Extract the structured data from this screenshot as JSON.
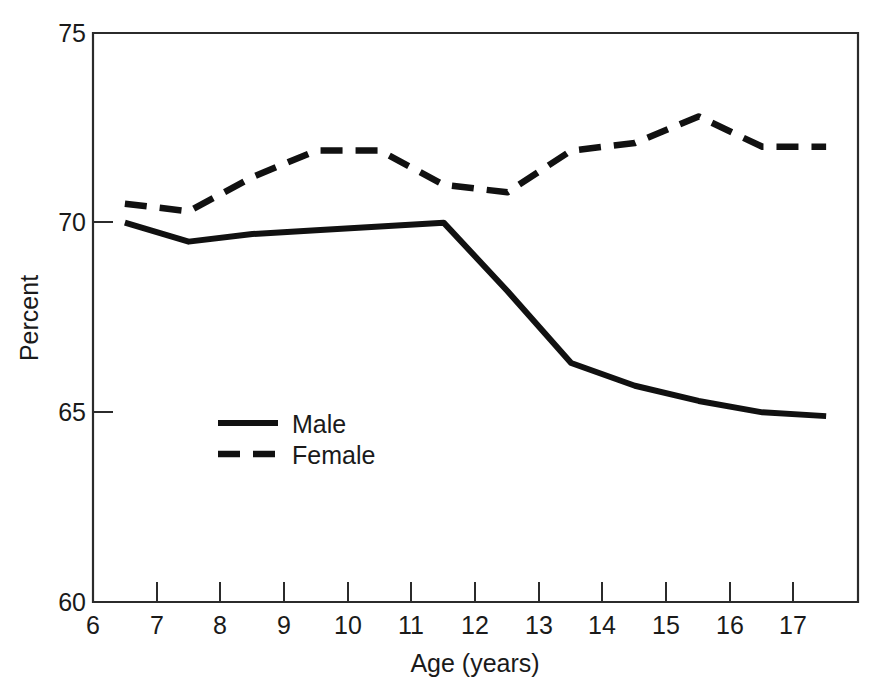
{
  "chart_data": {
    "type": "line",
    "title": "",
    "subtitle": "",
    "xlabel": "Age (years)",
    "ylabel": "Percent",
    "xlim": [
      6,
      18
    ],
    "ylim": [
      60,
      75
    ],
    "xticks": [
      6,
      7,
      8,
      9,
      10,
      11,
      12,
      13,
      14,
      15,
      16,
      17
    ],
    "xtick_labels": [
      "6",
      "7",
      "8",
      "9",
      "10",
      "11",
      "12",
      "13",
      "14",
      "15",
      "16",
      "17"
    ],
    "yticks": [
      60,
      65,
      70,
      75
    ],
    "ytick_labels": [
      "60",
      "65",
      "70",
      "75"
    ],
    "grid": false,
    "legend_position": "center-left-inside",
    "x": [
      6.5,
      7.5,
      8.5,
      9.5,
      10.5,
      11.5,
      12.5,
      13.5,
      14.5,
      15.5,
      16.5,
      17.5
    ],
    "series": [
      {
        "name": "Male",
        "style": "solid",
        "color": "#111111",
        "values": [
          70.0,
          69.5,
          69.7,
          69.8,
          69.9,
          70.0,
          68.2,
          66.3,
          65.7,
          65.3,
          65.0,
          64.9
        ]
      },
      {
        "name": "Female",
        "style": "dashed",
        "color": "#111111",
        "values": [
          70.5,
          70.3,
          71.2,
          71.9,
          71.9,
          71.0,
          70.8,
          71.9,
          72.1,
          72.8,
          72.0,
          72.0
        ]
      }
    ]
  },
  "axes": {
    "y_axis_title": "Percent",
    "x_axis_title": "Age (years)",
    "y_tick_0": "75",
    "y_tick_1": "70",
    "y_tick_2": "65",
    "y_tick_3": "60",
    "x_tick_0": "6",
    "x_tick_1": "7",
    "x_tick_2": "8",
    "x_tick_3": "9",
    "x_tick_4": "10",
    "x_tick_5": "11",
    "x_tick_6": "12",
    "x_tick_7": "13",
    "x_tick_8": "14",
    "x_tick_9": "15",
    "x_tick_10": "16",
    "x_tick_11": "17"
  },
  "legend": {
    "entries": [
      {
        "label": "Male",
        "style": "solid"
      },
      {
        "label": "Female",
        "style": "dashed"
      }
    ],
    "male_label": "Male",
    "female_label": "Female"
  },
  "colors": {
    "line": "#111111",
    "axis": "#2b2b2b",
    "background": "#ffffff",
    "text": "#1a1a1a"
  }
}
